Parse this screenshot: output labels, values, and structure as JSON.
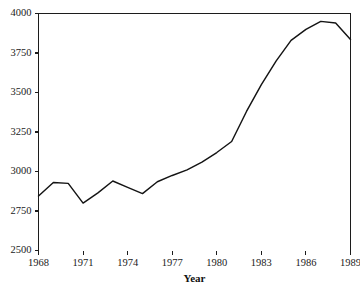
{
  "chart_data": {
    "type": "line",
    "title": "",
    "subtitle": "",
    "xlabel": "Year",
    "ylabel": "",
    "x": [
      1968,
      1969,
      1970,
      1971,
      1972,
      1973,
      1974,
      1975,
      1976,
      1977,
      1978,
      1979,
      1980,
      1981,
      1982,
      1983,
      1984,
      1985,
      1986,
      1987,
      1988,
      1989
    ],
    "values": [
      2845,
      2930,
      2925,
      2800,
      2865,
      2940,
      2900,
      2860,
      2935,
      2975,
      3010,
      3060,
      3120,
      3190,
      3380,
      3550,
      3700,
      3830,
      3900,
      3950,
      3940,
      3835
    ],
    "series": [
      {
        "name": "",
        "values": [
          2845,
          2930,
          2925,
          2800,
          2865,
          2940,
          2900,
          2860,
          2935,
          2975,
          3010,
          3060,
          3120,
          3190,
          3380,
          3550,
          3700,
          3830,
          3900,
          3950,
          3940,
          3835
        ]
      }
    ],
    "xlim": [
      1968,
      1989
    ],
    "ylim": [
      2500,
      4000
    ],
    "xticks": [
      1968,
      1971,
      1974,
      1977,
      1980,
      1983,
      1986,
      1989
    ],
    "xtick_labels": [
      "1968",
      "1971",
      "1974",
      "1977",
      "1980",
      "1983",
      "1986",
      "1989"
    ],
    "yticks": [
      2500,
      2750,
      3000,
      3250,
      3500,
      3750,
      4000
    ],
    "ytick_labels": [
      "2500",
      "2750",
      "3000",
      "3250",
      "3500",
      "3750",
      "4000"
    ],
    "grid": false,
    "legend": false,
    "legend_position": "none",
    "line_color": "#141414",
    "axis_color": "#1c1c1c",
    "background": "#ffffff"
  }
}
